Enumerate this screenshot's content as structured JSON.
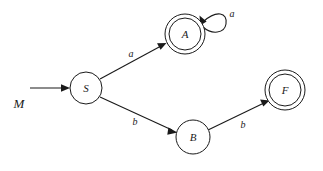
{
  "diagram": {
    "machine_label": "M",
    "type": "finite-automaton",
    "background_color": "#ffffff",
    "stroke_color": "#1a1a1a",
    "states": [
      {
        "id": "S",
        "label": "S",
        "accepting": false,
        "start": true,
        "cx": 86,
        "cy": 88,
        "r": 16
      },
      {
        "id": "A",
        "label": "A",
        "accepting": true,
        "start": false,
        "cx": 185,
        "cy": 34,
        "r": 20
      },
      {
        "id": "B",
        "label": "B",
        "accepting": false,
        "start": false,
        "cx": 193,
        "cy": 137,
        "r": 17
      },
      {
        "id": "F",
        "label": "F",
        "accepting": true,
        "start": false,
        "cx": 285,
        "cy": 90,
        "r": 20
      }
    ],
    "transitions": [
      {
        "from": "S",
        "to": "A",
        "symbol": "a",
        "label_x": 131,
        "label_y": 53
      },
      {
        "from": "S",
        "to": "B",
        "symbol": "b",
        "label_x": 135,
        "label_y": 121
      },
      {
        "from": "B",
        "to": "F",
        "symbol": "b",
        "label_x": 243,
        "label_y": 124
      },
      {
        "from": "A",
        "to": "A",
        "symbol": "a",
        "label_x": 232,
        "label_y": 13,
        "self_loop": true
      }
    ],
    "start_arrow": {
      "x1": 30,
      "y1": 88,
      "x2": 68,
      "y2": 88
    }
  }
}
